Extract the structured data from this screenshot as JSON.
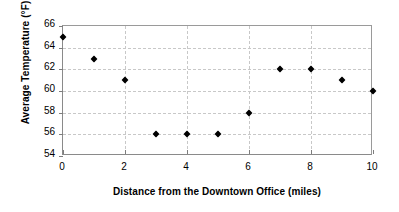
{
  "chart_data": {
    "type": "scatter",
    "title": "",
    "xlabel": "Distance from the Downtown Office (miles)",
    "ylabel": "Average Temperature (°F)",
    "xlim": [
      0,
      10
    ],
    "ylim": [
      54,
      66
    ],
    "xticks": [
      0,
      2,
      4,
      6,
      8,
      10
    ],
    "yticks": [
      54,
      56,
      58,
      60,
      62,
      64,
      66
    ],
    "xtick_labels": [
      "0",
      "2",
      "4",
      "6",
      "8",
      "10"
    ],
    "ytick_labels": [
      "54",
      "56",
      "58",
      "60",
      "62",
      "64",
      "66"
    ],
    "grid": true,
    "grid_style": "dashed",
    "grid_color": "#c8c8c8",
    "legend": false,
    "marker": "diamond",
    "marker_color": "#000000",
    "x": [
      0,
      1,
      2,
      3,
      4,
      5,
      6,
      7,
      8,
      9,
      10
    ],
    "y": [
      65,
      63,
      61,
      56,
      56,
      56,
      58,
      62,
      62,
      61,
      60
    ],
    "points": [
      {
        "x": 0,
        "y": 65
      },
      {
        "x": 1,
        "y": 63
      },
      {
        "x": 2,
        "y": 61
      },
      {
        "x": 3,
        "y": 56
      },
      {
        "x": 4,
        "y": 56
      },
      {
        "x": 5,
        "y": 56
      },
      {
        "x": 6,
        "y": 58
      },
      {
        "x": 7,
        "y": 62
      },
      {
        "x": 8,
        "y": 62
      },
      {
        "x": 9,
        "y": 61
      },
      {
        "x": 10,
        "y": 60
      }
    ]
  }
}
